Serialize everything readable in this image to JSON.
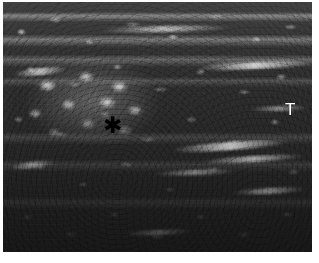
{
  "figure": {
    "modality": "ultrasound",
    "colormap": "grayscale",
    "width_px": 319,
    "height_px": 263,
    "background_color": "#ffffff"
  },
  "image_panel": {
    "left_px": 3,
    "top_px": 2,
    "width_px": 309,
    "height_px": 250,
    "base_color": "#2b2b2b",
    "darkest_color": "#1a1a1a",
    "brightest_color": "#f2f2f2"
  },
  "annotations": [
    {
      "id": "asterisk",
      "glyph": "✱",
      "label": "asterisk-marker",
      "color": "#000000",
      "x_px": 108,
      "y_px": 122,
      "meaning": "lesion"
    },
    {
      "id": "tendon",
      "glyph": "T",
      "label": "t-marker",
      "color": "#ffffff",
      "x_px": 289,
      "y_px": 108,
      "meaning": "tendon"
    }
  ],
  "regions": [
    {
      "name": "superficial-fascial-bands",
      "description": "horizontal hyperechoic linear bands"
    },
    {
      "name": "heteroechoic-lesion",
      "description": "nodular heterogeneous mass left of centre"
    },
    {
      "name": "fibrillar-tendon",
      "description": "bright linear striated fibres on the right"
    },
    {
      "name": "deep-hypoechoic-field",
      "description": "attenuated dark deep tissue"
    }
  ]
}
